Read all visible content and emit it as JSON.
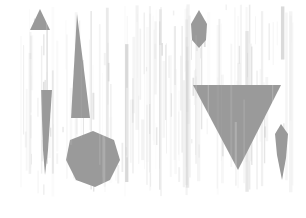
{
  "canvas": {
    "width": 306,
    "height": 218,
    "background_color": "#ffffff",
    "description": "Abstract grayscale composition of geometric shapes over vertical streak texture"
  },
  "palette": {
    "background": "#ffffff",
    "shape_fill": "#9a9a9a",
    "shape_fill_light": "#a8a8a8",
    "shape_fill_dark": "#8e8e8e",
    "streak_light": "#efefef",
    "streak_mid": "#e0e0e0",
    "streak_dark": "#cfcfcf"
  },
  "content_bounds": {
    "left": 20,
    "top": 4,
    "right": 292,
    "bottom": 197
  },
  "texture": {
    "type": "vertical-streaks",
    "orientation": "vertical",
    "region": {
      "x": 20,
      "y": 4,
      "width": 272,
      "height": 193
    },
    "streak_count": 96,
    "opacity_range": [
      0.12,
      0.85
    ],
    "width_range_px": [
      0.5,
      3.5
    ]
  },
  "shapes": [
    {
      "id": 1,
      "name": "small-up-triangle",
      "type": "triangle",
      "orientation": "up",
      "fill": "#9a9a9a",
      "points": "40,9 50,30 30,30",
      "bbox": {
        "x": 30,
        "y": 9,
        "width": 20,
        "height": 21
      }
    },
    {
      "id": 2,
      "name": "tall-tapered-triangle",
      "type": "triangle",
      "orientation": "up-narrow",
      "fill": "#9a9a9a",
      "points": "77,14 90,118 71,118",
      "bbox": {
        "x": 71,
        "y": 14,
        "width": 19,
        "height": 104
      }
    },
    {
      "id": 3,
      "name": "left-sliver-taper",
      "type": "sliver",
      "orientation": "vertical",
      "fill": "#9a9a9a",
      "points": "41,90 52,90 48,150 45,175 43,150",
      "bbox": {
        "x": 41,
        "y": 90,
        "width": 11,
        "height": 85
      }
    },
    {
      "id": 4,
      "name": "center-hex-blob",
      "type": "hexagon-blob",
      "orientation": "none",
      "fill": "#9a9a9a",
      "points": "93,131 114,140 120,160 110,180 95,187 76,180 66,160 70,140",
      "bbox": {
        "x": 66,
        "y": 131,
        "width": 54,
        "height": 56
      }
    },
    {
      "id": 5,
      "name": "top-right-leaf-diamond",
      "type": "diamond-leaf",
      "orientation": "vertical",
      "fill": "#9a9a9a",
      "points": "199,10 207,24 206,40 199,48 192,40 191,24",
      "bbox": {
        "x": 191,
        "y": 10,
        "width": 16,
        "height": 38
      }
    },
    {
      "id": 6,
      "name": "large-down-triangle",
      "type": "triangle",
      "orientation": "down",
      "fill": "#9a9a9a",
      "points": "193,85 281,85 238,170",
      "bbox": {
        "x": 193,
        "y": 85,
        "width": 88,
        "height": 85
      }
    },
    {
      "id": 7,
      "name": "right-sliver-taper",
      "type": "sliver",
      "orientation": "vertical",
      "fill": "#9a9a9a",
      "points": "281,124 288,134 286,158 282,180 277,155 275,134",
      "bbox": {
        "x": 275,
        "y": 124,
        "width": 13,
        "height": 56
      }
    }
  ]
}
